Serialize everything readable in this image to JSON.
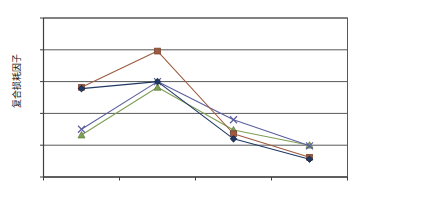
{
  "chart_data": {
    "type": "line",
    "title": "",
    "subtitle": "",
    "xlabel": "",
    "ylabel": "复合损耗因子",
    "categories": [
      "0℃",
      "20℃",
      "40℃",
      "60℃"
    ],
    "ylim": [
      0,
      0.25
    ],
    "yticks": [
      "0",
      "0.05",
      "0.1",
      "0.15",
      "0.2",
      "0.25"
    ],
    "ytick_values": [
      0,
      0.05,
      0.1,
      0.15,
      0.2,
      0.25
    ],
    "grid": true,
    "legend_position": "right",
    "series": [
      {
        "name": "LASD样件1",
        "sub": "厚度：2.0mm",
        "color": "#1f3864",
        "marker": "diamond",
        "values": [
          0.139,
          0.15,
          0.06,
          0.028
        ]
      },
      {
        "name": "LASD样件2",
        "sub": "厚度：2.5mm",
        "color": "#9c5b40",
        "marker": "square",
        "values": [
          0.141,
          0.198,
          0.068,
          0.031
        ]
      },
      {
        "name": "阻尼垫样件1",
        "sub": "厚度：2.0mm",
        "color": "#7f9f55",
        "marker": "triangle",
        "values": [
          0.066,
          0.141,
          0.074,
          0.05
        ]
      },
      {
        "name": "阻尼垫样件2",
        "sub": "厚度：2.5mm",
        "color": "#5a5f9e",
        "marker": "cross",
        "values": [
          0.075,
          0.15,
          0.09,
          0.049
        ]
      }
    ]
  },
  "legend": {
    "entries": [
      {
        "label": "LASD样件1",
        "sub": "厚度：2.0mm"
      },
      {
        "label": "LASD样件2",
        "sub": "厚度：2.5mm"
      },
      {
        "label": "阻尼垫样件1",
        "sub": "厚度：2.0mm"
      },
      {
        "label": "阻尼垫样件2",
        "sub": "厚度：2.5mm"
      }
    ]
  },
  "axis": {
    "y_title": "复合损耗因子",
    "y_ticks": [
      "0.25",
      "0.2",
      "0.15",
      "0.1",
      "0.05",
      "0"
    ],
    "x_ticks": [
      "0℃",
      "20℃",
      "40℃",
      "60℃"
    ]
  }
}
